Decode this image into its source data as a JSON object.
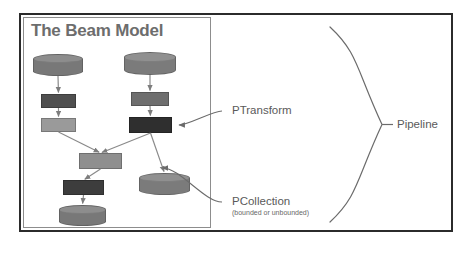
{
  "figure": {
    "title": "The Beam Model",
    "title_color": "#6d6d6d",
    "frame_color": "#2b2b2b",
    "panel_border_color": "#8d8d8d",
    "background": "#ffffff"
  },
  "palette": {
    "cylinder_gray": "#787878",
    "transform_dark": "#4a4a4a",
    "transform_darkest": "#333333",
    "transform_mid": "#6e6e6e",
    "transform_light": "#9a9a9a",
    "connector_gray": "#8a8a8a",
    "callout_gray": "#5a5a5a"
  },
  "nodes": [
    {
      "id": "src-left",
      "kind": "cylinder",
      "role": "PCollection",
      "x": 33,
      "y": 54,
      "w": 50,
      "h": 22,
      "color": "#787878"
    },
    {
      "id": "src-right",
      "kind": "cylinder",
      "role": "PCollection",
      "x": 124,
      "y": 52,
      "w": 52,
      "h": 23,
      "color": "#7b7b7b"
    },
    {
      "id": "xf-left-1",
      "kind": "box",
      "role": "PTransform",
      "x": 41,
      "y": 94,
      "w": 35,
      "h": 14,
      "color": "#4f4f4f"
    },
    {
      "id": "xf-right-1",
      "kind": "box",
      "role": "PTransform",
      "x": 131,
      "y": 92,
      "w": 38,
      "h": 14,
      "color": "#6e6e6e"
    },
    {
      "id": "xf-left-2",
      "kind": "box",
      "role": "PTransform",
      "x": 41,
      "y": 118,
      "w": 35,
      "h": 14,
      "color": "#9a9a9a"
    },
    {
      "id": "xf-right-2",
      "kind": "box",
      "role": "PTransform",
      "x": 129,
      "y": 117,
      "w": 43,
      "h": 16,
      "color": "#2f2f2f"
    },
    {
      "id": "xf-merge",
      "kind": "box",
      "role": "PTransform",
      "x": 79,
      "y": 153,
      "w": 43,
      "h": 16,
      "color": "#8f8f8f"
    },
    {
      "id": "xf-out-left",
      "kind": "box",
      "role": "PTransform",
      "x": 63,
      "y": 180,
      "w": 41,
      "h": 15,
      "color": "#3d3d3d"
    },
    {
      "id": "sink-left",
      "kind": "cylinder",
      "role": "PCollection",
      "x": 59,
      "y": 205,
      "w": 47,
      "h": 21,
      "color": "#787878"
    },
    {
      "id": "sink-right",
      "kind": "cylinder",
      "role": "PCollection",
      "x": 139,
      "y": 173,
      "w": 51,
      "h": 22,
      "color": "#7b7b7b"
    }
  ],
  "edges": [
    {
      "from": "src-left",
      "to": "xf-left-1",
      "arrow": true
    },
    {
      "from": "xf-left-1",
      "to": "xf-left-2",
      "arrow": true
    },
    {
      "from": "src-right",
      "to": "xf-right-1",
      "arrow": true
    },
    {
      "from": "xf-right-1",
      "to": "xf-right-2",
      "arrow": true
    },
    {
      "from": "xf-left-2",
      "to": "xf-merge",
      "arrow": true
    },
    {
      "from": "xf-right-2",
      "to": "xf-merge",
      "arrow": true
    },
    {
      "from": "xf-merge",
      "to": "xf-out-left",
      "arrow": true
    },
    {
      "from": "xf-out-left",
      "to": "sink-left",
      "arrow": true
    },
    {
      "from": "xf-right-2",
      "to": "sink-right",
      "arrow": true
    }
  ],
  "callouts": [
    {
      "id": "ptransform",
      "label": "PTransform",
      "sublabel": "",
      "label_x": 232,
      "label_y": 104,
      "points_to": "xf-right-2"
    },
    {
      "id": "pcollection",
      "label": "PCollection",
      "sublabel": "(bounded or unbounded)",
      "label_x": 232,
      "label_y": 195,
      "points_to": "sink-right"
    }
  ],
  "brace": {
    "label": "Pipeline",
    "label_x": 397,
    "label_y": 117,
    "top_y": 27,
    "bottom_y": 222,
    "x": 330,
    "tip_x": 382
  }
}
